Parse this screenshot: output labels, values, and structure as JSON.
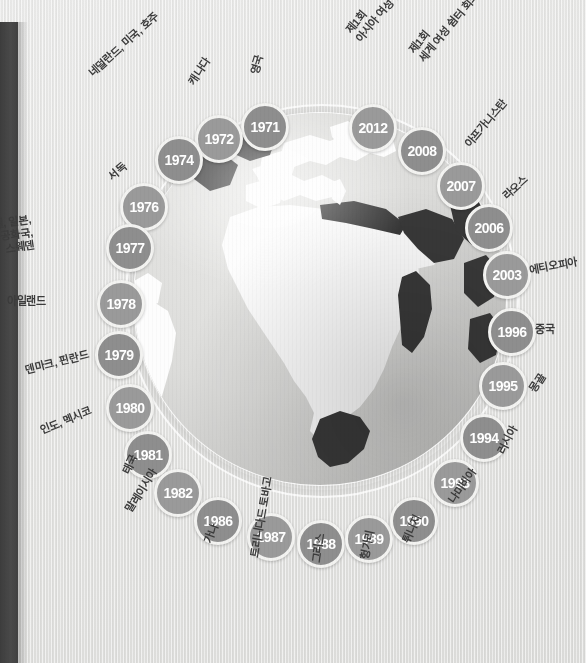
{
  "meta": {
    "background_color": "#e3e3e1",
    "bubble_color": "#8e8e8e",
    "bubble_ring_color": "#f3f3f1",
    "label_color": "#3c3c3c",
    "spine_color": "#414141",
    "land_color": "#fdfdfd",
    "land_highlight_color": "#3a3a3a"
  },
  "globe": {
    "name": "world-globe",
    "view": "Africa / Europe / Middle East hemisphere"
  },
  "timeline": {
    "title": "",
    "nodes": [
      {
        "year": "1971",
        "label": "영국",
        "x": 262,
        "y": 124,
        "lx": 248,
        "ly": 72,
        "rot": -73,
        "align": "left"
      },
      {
        "year": "1972",
        "label": "캐나다",
        "x": 216,
        "y": 136,
        "lx": 186,
        "ly": 80,
        "rot": -56,
        "align": "left"
      },
      {
        "year": "1974",
        "label": "네덜란드, 미국, 호주",
        "x": 176,
        "y": 157,
        "lx": 86,
        "ly": 70,
        "rot": -42,
        "align": "left"
      },
      {
        "year": "1976",
        "label": "서독",
        "x": 141,
        "y": 204,
        "lx": 106,
        "ly": 173,
        "rot": -40,
        "align": "left"
      },
      {
        "year": "1977",
        "label": "이스라엘, 일본,\n남아프리카 공화국,\n스웨덴",
        "x": 127,
        "y": 245,
        "lx": 30,
        "ly": 213,
        "rot": -8,
        "align": "right"
      },
      {
        "year": "1978",
        "label": "아일랜드",
        "x": 118,
        "y": 301,
        "lx": 46,
        "ly": 295,
        "rot": 0,
        "align": "right"
      },
      {
        "year": "1979",
        "label": "덴마크, 핀란드",
        "x": 116,
        "y": 352,
        "lx": 24,
        "ly": 364,
        "rot": -14,
        "align": "left"
      },
      {
        "year": "1980",
        "label": "인도, 멕시코",
        "x": 127,
        "y": 405,
        "lx": 38,
        "ly": 425,
        "rot": -22,
        "align": "left"
      },
      {
        "year": "1981",
        "label": "태국",
        "x": 145,
        "y": 452,
        "lx": 120,
        "ly": 470,
        "rot": -63,
        "align": "left"
      },
      {
        "year": "1982",
        "label": "말레이시아",
        "x": 175,
        "y": 490,
        "lx": 123,
        "ly": 508,
        "rot": -58,
        "align": "left"
      },
      {
        "year": "1986",
        "label": "가나",
        "x": 215,
        "y": 518,
        "lx": 202,
        "ly": 541,
        "rot": -70,
        "align": "left"
      },
      {
        "year": "1987",
        "label": "트리니다드 토바고",
        "x": 268,
        "y": 534,
        "lx": 248,
        "ly": 556,
        "rot": -80,
        "align": "left"
      },
      {
        "year": "1988",
        "label": "그리스",
        "x": 318,
        "y": 541,
        "lx": 310,
        "ly": 562,
        "rot": -82,
        "align": "left"
      },
      {
        "year": "1989",
        "label": "헝가리",
        "x": 366,
        "y": 536,
        "lx": 358,
        "ly": 558,
        "rot": -78,
        "align": "left"
      },
      {
        "year": "1990",
        "label": "튀니지",
        "x": 411,
        "y": 518,
        "lx": 400,
        "ly": 540,
        "rot": -65,
        "align": "left"
      },
      {
        "year": "1993",
        "label": "나미비아",
        "x": 452,
        "y": 480,
        "lx": 446,
        "ly": 498,
        "rot": -55,
        "align": "left"
      },
      {
        "year": "1994",
        "label": "러시아",
        "x": 481,
        "y": 435,
        "lx": 495,
        "ly": 450,
        "rot": -62,
        "align": "left"
      },
      {
        "year": "1995",
        "label": "몽골",
        "x": 500,
        "y": 383,
        "lx": 527,
        "ly": 388,
        "rot": -58,
        "align": "left"
      },
      {
        "year": "1996",
        "label": "중국",
        "x": 509,
        "y": 329,
        "lx": 535,
        "ly": 323,
        "rot": 0,
        "align": "left"
      },
      {
        "year": "2003",
        "label": "에티오피아",
        "x": 504,
        "y": 272,
        "lx": 528,
        "ly": 264,
        "rot": -10,
        "align": "left"
      },
      {
        "year": "2006",
        "label": "라오스",
        "x": 486,
        "y": 225,
        "lx": 500,
        "ly": 193,
        "rot": -42,
        "align": "left"
      },
      {
        "year": "2007",
        "label": "아프가니스탄",
        "x": 458,
        "y": 183,
        "lx": 462,
        "ly": 142,
        "rot": -50,
        "align": "left"
      },
      {
        "year": "2008",
        "label": "제1회\n세계 여성 쉼터 회의",
        "x": 419,
        "y": 148,
        "lx": 406,
        "ly": 48,
        "rot": -50,
        "align": "left"
      },
      {
        "year": "2012",
        "label": "제1회\n아시아 여성 쉼터 회의",
        "x": 370,
        "y": 125,
        "lx": 343,
        "ly": 28,
        "rot": -50,
        "align": "left"
      }
    ]
  },
  "chart_data": {
    "type": "scatter",
    "xlabel": "",
    "ylabel": "",
    "categories": [
      "1971",
      "1972",
      "1974",
      "1976",
      "1977",
      "1978",
      "1979",
      "1980",
      "1981",
      "1982",
      "1986",
      "1987",
      "1988",
      "1989",
      "1990",
      "1993",
      "1994",
      "1995",
      "1996",
      "2003",
      "2006",
      "2007",
      "2008",
      "2012"
    ],
    "values": [
      1971,
      1972,
      1974,
      1976,
      1977,
      1978,
      1979,
      1980,
      1981,
      1982,
      1986,
      1987,
      1988,
      1989,
      1990,
      1993,
      1994,
      1995,
      1996,
      2003,
      2006,
      2007,
      2008,
      2012
    ],
    "annotations": [
      "1971 영국",
      "1972 캐나다",
      "1974 네덜란드, 미국, 호주",
      "1976 서독",
      "1977 이스라엘, 일본, 남아프리카 공화국, 스웨덴",
      "1978 아일랜드",
      "1979 덴마크, 핀란드",
      "1980 인도, 멕시코",
      "1981 태국",
      "1982 말레이시아",
      "1986 가나",
      "1987 트리니다드 토바고",
      "1988 그리스",
      "1989 헝가리",
      "1990 튀니지",
      "1993 나미비아",
      "1994 러시아",
      "1995 몽골",
      "1996 중국",
      "2003 에티오피아",
      "2006 라오스",
      "2007 아프가니스탄",
      "2008 제1회 세계 여성 쉼터 회의",
      "2012 제1회 아시아 여성 쉼터 회의"
    ],
    "legend": [],
    "grid": false
  }
}
